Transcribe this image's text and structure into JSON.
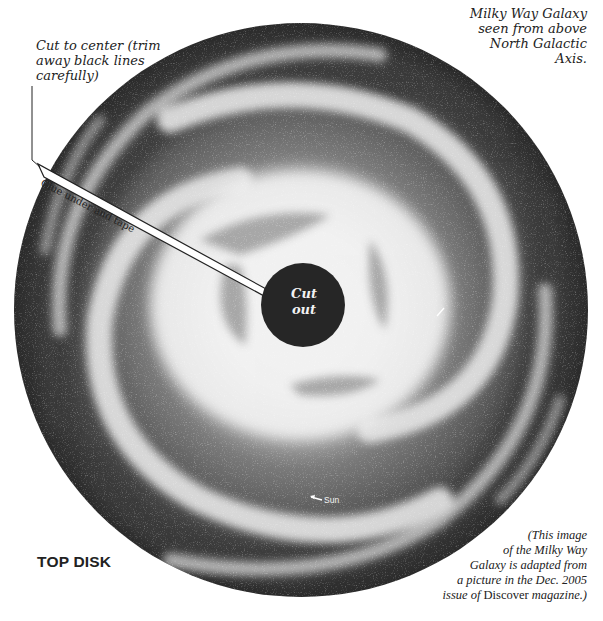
{
  "figure": {
    "title_note": [
      "Milky Way Galaxy",
      "seen from above",
      "North Galactic",
      "Axis."
    ],
    "cut_instruction": [
      "Cut to center (trim",
      "away black lines",
      "carefully)"
    ],
    "glue_strip_label": "Glue under and tape",
    "center_label": [
      "Cut",
      "out"
    ],
    "sun_label": "Sun",
    "disk_name": "TOP DISK",
    "credit": {
      "line1": "(This image",
      "line2": "of the Milky Way",
      "line3": "Galaxy is adapted from",
      "line4": "a picture in the Dec. 2005",
      "line5_prefix": "issue of ",
      "line5_magazine": "Discover",
      "line5_suffix": " magazine.)"
    }
  },
  "geometry": {
    "disk_center": [
      301,
      310
    ],
    "disk_radius": 287,
    "cutout_center": [
      303,
      305
    ],
    "cutout_radius": 42
  },
  "colors": {
    "disk_dark": "#2e2e2e",
    "arm_light": "#e8e8e8",
    "core_light": "#f4f4f4",
    "cutout": "#262626",
    "text": "#222222"
  }
}
